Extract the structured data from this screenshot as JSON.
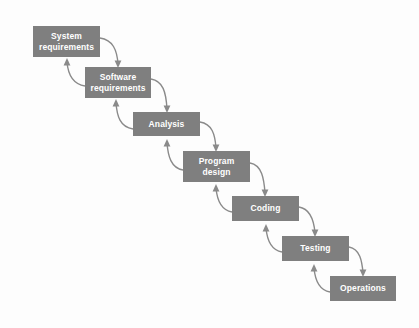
{
  "diagram": {
    "type": "flow-diagram",
    "background_color": "#fdfdfd",
    "box_color": "#7f7f7f",
    "text_color": "#ffffff",
    "arrow_color": "#8a8a8a",
    "stages": [
      {
        "id": "system-requirements",
        "label": "System\nrequirements",
        "x": 33,
        "y": 26,
        "w": 67,
        "h": 31
      },
      {
        "id": "software-requirements",
        "label": "Software\nrequirements",
        "x": 85,
        "y": 67,
        "w": 66,
        "h": 31
      },
      {
        "id": "analysis",
        "label": "Analysis",
        "x": 133,
        "y": 112,
        "w": 67,
        "h": 24
      },
      {
        "id": "program-design",
        "label": "Program\ndesign",
        "x": 183,
        "y": 151,
        "w": 67,
        "h": 31
      },
      {
        "id": "coding",
        "label": "Coding",
        "x": 232,
        "y": 196,
        "w": 67,
        "h": 25
      },
      {
        "id": "testing",
        "label": "Testing",
        "x": 282,
        "y": 236,
        "w": 67,
        "h": 25
      },
      {
        "id": "operations",
        "label": "Operations",
        "x": 330,
        "y": 276,
        "w": 66,
        "h": 25
      }
    ],
    "forward_arrows": [
      {
        "from": "system-requirements",
        "to": "software-requirements",
        "d": "M 100 38 C 113 40 117 50 118 64",
        "head": "M 118 68 L 114.6 60.5 L 121.4 60.5 Z"
      },
      {
        "from": "software-requirements",
        "to": "analysis",
        "d": "M 151 79 C 163 81 166 92 167 109",
        "head": "M 167 113 L 163.6 105.5 L 170.4 105.5 Z"
      },
      {
        "from": "analysis",
        "to": "program-design",
        "d": "M 200 122 C 212 124 215 134 216 148",
        "head": "M 216 152 L 212.6 144.5 L 219.4 144.5 Z"
      },
      {
        "from": "program-design",
        "to": "coding",
        "d": "M 250 163 C 262 165 264 179 265 193",
        "head": "M 265 197 L 261.6 189.5 L 268.4 189.5 Z"
      },
      {
        "from": "coding",
        "to": "testing",
        "d": "M 299 207 C 311 209 314 221 315 233",
        "head": "M 315 237 L 311.6 229.5 L 318.4 229.5 Z"
      },
      {
        "from": "testing",
        "to": "operations",
        "d": "M 349 247 C 360 249 362 261 363 273",
        "head": "M 363 277 L 359.6 269.5 L 366.4 269.5 Z"
      }
    ],
    "backward_arrows": [
      {
        "from": "software-requirements",
        "to": "system-requirements",
        "d": "M 85 86 C 72 84 68 74 67 62",
        "head": "M 67 58 L 70.4 65.5 L 63.6 65.5 Z"
      },
      {
        "from": "analysis",
        "to": "software-requirements",
        "d": "M 133 129 C 120 127 117 116 116 103",
        "head": "M 116 99 L 119.4 106.5 L 112.6 106.5 Z"
      },
      {
        "from": "program-design",
        "to": "analysis",
        "d": "M 183 170 C 171 168 168 156 167 143",
        "head": "M 167 139 L 170.4 146.5 L 163.6 146.5 Z"
      },
      {
        "from": "coding",
        "to": "program-design",
        "d": "M 232 212 C 220 210 217 199 216 188",
        "head": "M 216 184 L 219.4 191.5 L 212.6 191.5 Z"
      },
      {
        "from": "testing",
        "to": "coding",
        "d": "M 282 252 C 270 250 267 239 266 228",
        "head": "M 266 224 L 269.4 231.5 L 262.6 231.5 Z"
      },
      {
        "from": "operations",
        "to": "testing",
        "d": "M 330 292 C 318 290 315 279 314 268",
        "head": "M 314 264 L 317.4 271.5 L 310.6 271.5 Z"
      }
    ]
  },
  "chart_data": {
    "type": "diagram",
    "nodes": [
      "System requirements",
      "Software requirements",
      "Analysis",
      "Program design",
      "Coding",
      "Testing",
      "Operations"
    ],
    "edges_forward": [
      [
        "System requirements",
        "Software requirements"
      ],
      [
        "Software requirements",
        "Analysis"
      ],
      [
        "Analysis",
        "Program design"
      ],
      [
        "Program design",
        "Coding"
      ],
      [
        "Coding",
        "Testing"
      ],
      [
        "Testing",
        "Operations"
      ]
    ],
    "edges_backward": [
      [
        "Software requirements",
        "System requirements"
      ],
      [
        "Analysis",
        "Software requirements"
      ],
      [
        "Program design",
        "Analysis"
      ],
      [
        "Coding",
        "Program design"
      ],
      [
        "Testing",
        "Coding"
      ],
      [
        "Operations",
        "Testing"
      ]
    ]
  }
}
